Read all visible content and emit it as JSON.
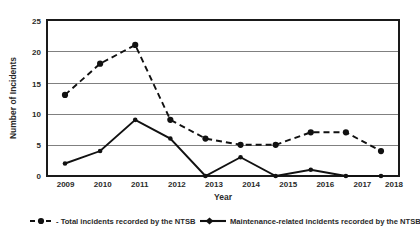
{
  "chart_data": {
    "type": "line",
    "title": "",
    "xlabel": "Year",
    "ylabel": "Number of Incidents",
    "categories": [
      "2009",
      "2010",
      "2011",
      "2012",
      "2013",
      "2014",
      "2015",
      "2016",
      "2017",
      "2018"
    ],
    "x": [
      2009,
      2010,
      2011,
      2012,
      2013,
      2014,
      2015,
      2016,
      2017,
      2018
    ],
    "series": [
      {
        "name": "- Total incidents recorded by the NTSB",
        "style": "dashed",
        "marker": "circle",
        "values": [
          13,
          18,
          21,
          9,
          6,
          5,
          5,
          7,
          7,
          4
        ]
      },
      {
        "name": "Maintenance-related incidents recorded by the NTSB",
        "style": "solid",
        "marker": "circle",
        "values": [
          2,
          4,
          9,
          6,
          0,
          3,
          0,
          1,
          0,
          0
        ]
      }
    ],
    "yticks": [
      0,
      5,
      10,
      15,
      20,
      25
    ],
    "ytick_labels": [
      "0",
      "5",
      "10",
      "15",
      "20",
      "25"
    ],
    "ylim": [
      0,
      25
    ],
    "xlim": [
      2009,
      2018
    ],
    "grid": "horizontal",
    "legend_position": "bottom",
    "colors": {
      "series_line": "#111111",
      "gridline": "#808080",
      "frame": "#1a1a1a",
      "text": "#2a2a2a",
      "background": "#ffffff"
    }
  },
  "axis": {
    "y_title": "Number of Incidents",
    "x_title": "Year",
    "y_tick_0": "0",
    "y_tick_1": "5",
    "y_tick_2": "10",
    "y_tick_3": "15",
    "y_tick_4": "20",
    "y_tick_5": "25",
    "x_tick_0": "2009",
    "x_tick_1": "2010",
    "x_tick_2": "2011",
    "x_tick_3": "2012",
    "x_tick_4": "2013",
    "x_tick_5": "2014",
    "x_tick_6": "2015",
    "x_tick_7": "2016",
    "x_tick_8": "2017",
    "x_tick_9": "2018"
  },
  "legend": {
    "items": [
      {
        "label": "- Total incidents recorded by the NTSB",
        "style": "dashed"
      },
      {
        "label": "Maintenance-related incidents recorded by the NTSB",
        "style": "solid"
      }
    ],
    "item_0_label": "- Total incidents recorded by the NTSB",
    "item_1_label": "Maintenance-related incidents recorded by the NTSB"
  }
}
